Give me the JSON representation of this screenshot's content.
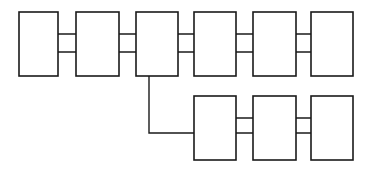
{
  "diagram": {
    "type": "block-chain-diagram",
    "canvas": {
      "width": 369,
      "height": 169,
      "background": "#ffffff"
    },
    "style": {
      "node_stroke": "#1a1a1a",
      "node_fill": "#ffffff",
      "node_stroke_width": 1.6,
      "link_stroke": "#1a1a1a",
      "link_stroke_width": 1.4,
      "arrow_fill": "#1a1a1a",
      "arrow_length": 7,
      "arrow_half_width": 3.1
    },
    "rows": [
      {
        "id": "row-top",
        "name": "top-row",
        "label": "",
        "y_top": 12,
        "y_bottom": 76,
        "nodes": [
          {
            "id": "node-1",
            "name": "block-1",
            "label": "",
            "x": 19,
            "y": 12,
            "width": 39,
            "height": 64
          },
          {
            "id": "node-2",
            "name": "block-2",
            "label": "",
            "x": 76,
            "y": 12,
            "width": 43,
            "height": 64
          },
          {
            "id": "node-3",
            "name": "block-3",
            "label": "",
            "x": 136,
            "y": 12,
            "width": 42,
            "height": 64
          },
          {
            "id": "node-4",
            "name": "block-4",
            "label": "",
            "x": 194,
            "y": 12,
            "width": 42,
            "height": 64
          },
          {
            "id": "node-5",
            "name": "block-5",
            "label": "",
            "x": 253,
            "y": 12,
            "width": 43,
            "height": 64
          },
          {
            "id": "node-6",
            "name": "block-6",
            "label": "",
            "x": 311,
            "y": 12,
            "width": 42,
            "height": 64
          }
        ]
      },
      {
        "id": "row-bottom",
        "name": "bottom-row",
        "label": "",
        "y_top": 96,
        "y_bottom": 160,
        "nodes": [
          {
            "id": "node-7",
            "name": "block-7",
            "label": "",
            "x": 194,
            "y": 96,
            "width": 42,
            "height": 64
          },
          {
            "id": "node-8",
            "name": "block-8",
            "label": "",
            "x": 253,
            "y": 96,
            "width": 43,
            "height": 64
          },
          {
            "id": "node-9",
            "name": "block-9",
            "label": "",
            "x": 311,
            "y": 96,
            "width": 42,
            "height": 64
          }
        ]
      }
    ],
    "links": [
      {
        "id": "link-1-2-fwd",
        "name": "arrow-block1-to-block2",
        "direction": "right",
        "row": "top",
        "y": 34,
        "x_start": 40,
        "x_end": 95
      },
      {
        "id": "link-2-1-rev",
        "name": "arrow-block2-to-block1",
        "direction": "left",
        "row": "top",
        "y": 52,
        "x_start": 98,
        "x_end": 40
      },
      {
        "id": "link-2-3-fwd",
        "name": "arrow-block2-to-block3",
        "direction": "right",
        "row": "top",
        "y": 34,
        "x_start": 100,
        "x_end": 155
      },
      {
        "id": "link-3-2-rev",
        "name": "arrow-block3-to-block2",
        "direction": "left",
        "row": "top",
        "y": 52,
        "x_start": 158,
        "x_end": 98
      },
      {
        "id": "link-3-4-fwd",
        "name": "arrow-block3-to-block4",
        "direction": "right",
        "row": "top",
        "y": 34,
        "x_start": 158,
        "x_end": 214
      },
      {
        "id": "link-4-3-rev",
        "name": "arrow-block4-to-block3",
        "direction": "left",
        "row": "top",
        "y": 52,
        "x_start": 217,
        "x_end": 157
      },
      {
        "id": "link-4-5-fwd",
        "name": "arrow-block4-to-block5",
        "direction": "right",
        "row": "top",
        "y": 34,
        "x_start": 217,
        "x_end": 272
      },
      {
        "id": "link-5-4-rev",
        "name": "arrow-block5-to-block4",
        "direction": "left",
        "row": "top",
        "y": 52,
        "x_start": 275,
        "x_end": 215
      },
      {
        "id": "link-5-6-fwd",
        "name": "arrow-block5-to-block6",
        "direction": "right",
        "row": "top",
        "y": 34,
        "x_start": 275,
        "x_end": 331
      },
      {
        "id": "link-6-5-rev",
        "name": "arrow-block6-to-block5",
        "direction": "left",
        "row": "top",
        "y": 52,
        "x_start": 334,
        "x_end": 274
      },
      {
        "id": "link-7-8-fwd",
        "name": "arrow-block7-to-block8",
        "direction": "right",
        "row": "bottom",
        "y": 118,
        "x_start": 216,
        "x_end": 272
      },
      {
        "id": "link-8-7-rev",
        "name": "arrow-block8-to-block7",
        "direction": "left",
        "row": "bottom",
        "y": 133,
        "x_start": 275,
        "x_end": 215
      },
      {
        "id": "link-8-9-fwd",
        "name": "arrow-block8-to-block9",
        "direction": "right",
        "row": "bottom",
        "y": 118,
        "x_start": 275,
        "x_end": 331
      },
      {
        "id": "link-9-8-rev",
        "name": "arrow-block9-to-block8",
        "direction": "left",
        "row": "bottom",
        "y": 133,
        "x_start": 334,
        "x_end": 274
      }
    ],
    "wrap_link": {
      "id": "link-3-7-wrap",
      "name": "arrow-block3-to-block7-wrap",
      "direction": "right",
      "x_vertical": 149,
      "y_start": 52,
      "y_corner": 133,
      "x_end": 207
    }
  }
}
